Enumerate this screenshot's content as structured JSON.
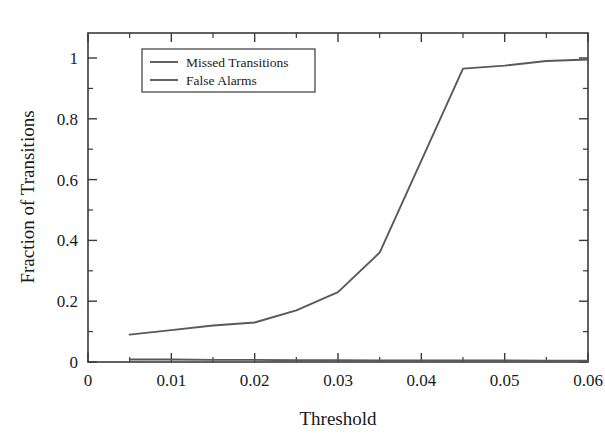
{
  "chart_data": {
    "type": "line",
    "title": "",
    "xlabel": "Threshold",
    "ylabel": "Fraction of Transitions",
    "xlim": [
      0,
      0.06
    ],
    "ylim": [
      0,
      1.095
    ],
    "grid": false,
    "legend_position": "top-left-inside",
    "x_ticks": [
      0,
      0.01,
      0.02,
      0.03,
      0.04,
      0.05,
      0.06
    ],
    "x_tick_labels": [
      "0",
      "0.01",
      "0.02",
      "0.03",
      "0.04",
      "0.05",
      "0.06"
    ],
    "x_minor_ticks": [
      0.005,
      0.015,
      0.025,
      0.035,
      0.045,
      0.055
    ],
    "y_ticks": [
      0,
      0.2,
      0.4,
      0.6,
      0.8,
      1
    ],
    "y_tick_labels": [
      "0",
      "0.2",
      "0.4",
      "0.6",
      "0.8",
      "1"
    ],
    "y_minor_ticks": [
      0.1,
      0.3,
      0.5,
      0.7,
      0.9
    ],
    "series": [
      {
        "name": "Missed Transitions",
        "color": "#595959",
        "x": [
          0.005,
          0.01,
          0.015,
          0.02,
          0.025,
          0.03,
          0.035,
          0.045,
          0.05,
          0.055,
          0.06
        ],
        "values": [
          0.09,
          0.105,
          0.12,
          0.13,
          0.17,
          0.23,
          0.36,
          0.965,
          0.975,
          0.99,
          0.995
        ]
      },
      {
        "name": "False Alarms",
        "color": "#595959",
        "x": [
          0.005,
          0.01,
          0.015,
          0.02,
          0.025,
          0.03,
          0.035,
          0.045,
          0.05,
          0.055,
          0.06
        ],
        "values": [
          0.008,
          0.008,
          0.007,
          0.007,
          0.006,
          0.006,
          0.005,
          0.005,
          0.005,
          0.004,
          0.004
        ]
      }
    ]
  },
  "legend": {
    "entries": [
      {
        "label": "Missed Transitions"
      },
      {
        "label": "False Alarms"
      }
    ]
  },
  "axes": {
    "x_title": "Threshold",
    "y_title": "Fraction of Transitions"
  }
}
